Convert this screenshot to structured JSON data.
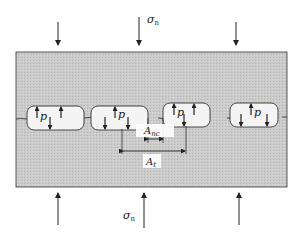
{
  "diagram": {
    "type": "contact-interface-schematic",
    "labels": {
      "top_stress": "σ",
      "top_stress_sub": "n",
      "bottom_stress": "σ",
      "bottom_stress_sub": "n",
      "pore_pressure": "p",
      "non_contact_area": "A",
      "non_contact_area_sub": "nc",
      "total_area": "A",
      "total_area_sub": "t"
    },
    "pores": [
      {
        "label": "p",
        "index": 1
      },
      {
        "label": "p",
        "index": 2
      },
      {
        "label": "p",
        "index": 3
      },
      {
        "label": "p",
        "index": 4
      }
    ],
    "colors": {
      "block_fill": "#c9c9c9",
      "pore_fill": "#f4f4f4",
      "line": "#2a2a2a",
      "background": "#ffffff"
    }
  }
}
